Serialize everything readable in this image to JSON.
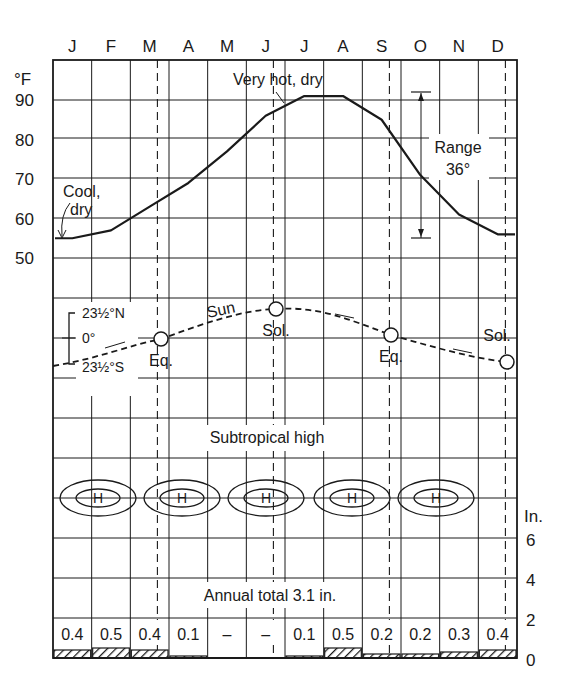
{
  "chart_data": {
    "type": "line",
    "title": "",
    "months": [
      "J",
      "F",
      "M",
      "A",
      "M",
      "J",
      "J",
      "A",
      "S",
      "O",
      "N",
      "D"
    ],
    "temperature": {
      "unit_label": "°F",
      "yticks": [
        "90",
        "80",
        "70",
        "60",
        "50"
      ],
      "ytick_values": [
        90,
        80,
        70,
        60,
        50
      ],
      "values": [
        55,
        57,
        63,
        69,
        77,
        86,
        91,
        91,
        85,
        71,
        61,
        56
      ],
      "annotations": {
        "cool": "Cool,",
        "cool2": "dry",
        "hot": "Very hot, dry",
        "range_label": "Range",
        "range_value": "36°"
      }
    },
    "sun": {
      "label": "Sun",
      "lat_north": "23½°N",
      "lat_zero": "0°",
      "lat_south": "23½°S",
      "equinox_label": "Eq.",
      "solstice_label": "Sol."
    },
    "pressure": {
      "label": "Subtropical high",
      "symbol": "H"
    },
    "precipitation": {
      "unit_label": "In.",
      "yticks": [
        "6",
        "4",
        "2",
        "0"
      ],
      "ytick_values": [
        6,
        4,
        2,
        0
      ],
      "values": [
        "0.4",
        "0.5",
        "0.4",
        "0.1",
        "–",
        "–",
        "0.1",
        "0.5",
        "0.2",
        "0.2",
        "0.3",
        "0.4"
      ],
      "numeric": [
        0.4,
        0.5,
        0.4,
        0.1,
        0,
        0,
        0.1,
        0.5,
        0.2,
        0.2,
        0.3,
        0.4
      ],
      "annual_total": "Annual total 3.1 in."
    }
  }
}
